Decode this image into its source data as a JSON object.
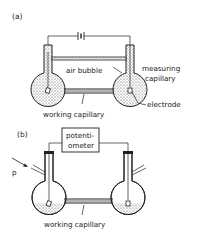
{
  "figure": {
    "panel_a": {
      "label": "(a)",
      "labels": {
        "air_bubble": "air bubble",
        "measuring_capillary_1": "measuring",
        "measuring_capillary_2": "capillary",
        "electrode": "electrode",
        "working_capillary": "working capillary"
      },
      "components": [
        "battery",
        "left-flask",
        "right-flask",
        "measuring-capillary",
        "working-capillary",
        "electrodes"
      ]
    },
    "panel_b": {
      "label": "(b)",
      "labels": {
        "potentiometer_1": "potenti-",
        "potentiometer_2": "ometer",
        "pressure": "p",
        "working_capillary": "working capillary"
      },
      "components": [
        "potentiometer",
        "left-flask",
        "right-flask",
        "working-capillary",
        "electrodes",
        "side-arms"
      ]
    }
  }
}
